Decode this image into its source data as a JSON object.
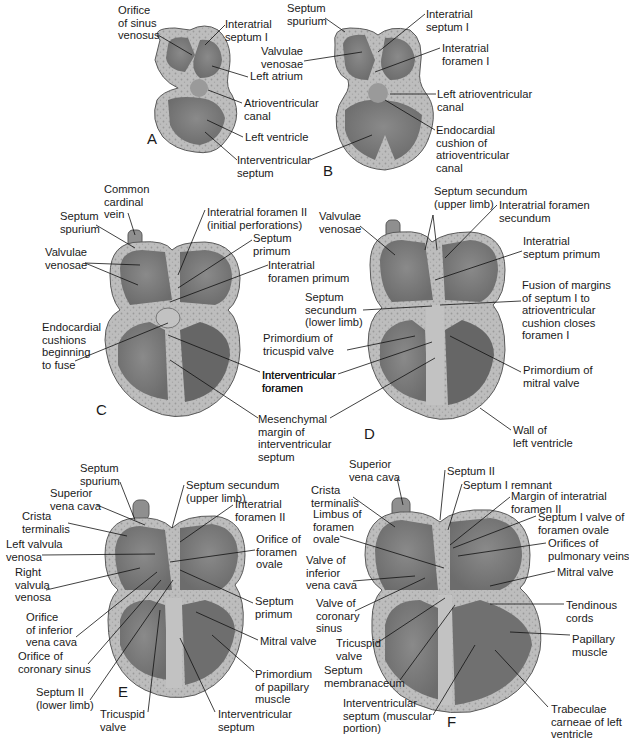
{
  "figure": {
    "colors": {
      "wall_outer": "#b7b7b7",
      "wall_stipple": "#a9a9a9",
      "chamber": "#7f7f7f",
      "chamber_dark": "#6a6a6a",
      "septum": "#bdbdbd",
      "outline": "#5a5a5a",
      "leader_line": "#111111"
    },
    "panels": [
      {
        "letter": "A",
        "labels": [
          {
            "text": "Orifice\nof sinus\nvenosus",
            "x": 118,
            "y": 4
          },
          {
            "text": "Interatrial\nseptum I",
            "x": 225,
            "y": 18
          },
          {
            "text": "Left atrium",
            "x": 250,
            "y": 70
          },
          {
            "text": "Atrioventricular\ncanal",
            "x": 244,
            "y": 97
          },
          {
            "text": "Left ventricle",
            "x": 245,
            "y": 131
          },
          {
            "text": "Interventricular\nseptum",
            "x": 237,
            "y": 154
          }
        ]
      },
      {
        "letter": "B",
        "labels": [
          {
            "text": "Septum\nspurium",
            "x": 287,
            "y": 2
          },
          {
            "text": "Interatrial\nseptum I",
            "x": 426,
            "y": 8
          },
          {
            "text": "Valvulae\nvenosae",
            "x": 261,
            "y": 45
          },
          {
            "text": "Interatrial\nforamen I",
            "x": 442,
            "y": 42
          },
          {
            "text": "Left atrioventricular\ncanal",
            "x": 437,
            "y": 88
          },
          {
            "text": "Endocardial\ncushion of\natrioventricular\ncanal",
            "x": 436,
            "y": 124
          }
        ]
      },
      {
        "letter": "C",
        "labels": [
          {
            "text": "Common\ncardinal\nvein",
            "x": 104,
            "y": 183
          },
          {
            "text": "Septum\nspurium",
            "x": 60,
            "y": 210
          },
          {
            "text": "Interatrial foramen II\n(initial perforations)",
            "x": 207,
            "y": 206
          },
          {
            "text": "Septum\nprimum",
            "x": 253,
            "y": 232
          },
          {
            "text": "Valvulae\nvenosae",
            "x": 45,
            "y": 246
          },
          {
            "text": "Interatrial\nforamen primum",
            "x": 268,
            "y": 259
          },
          {
            "text": "Endocardial\ncushions\nbeginning\nto fuse",
            "x": 42,
            "y": 321
          },
          {
            "text": "Interventricular\nforamen",
            "x": 262,
            "y": 369
          },
          {
            "text": "Mesenchymal\nmargin of\ninterventricular\nseptum",
            "x": 258,
            "y": 413
          }
        ]
      },
      {
        "letter": "D",
        "labels": [
          {
            "text": "Septum secundum\n(upper limb)",
            "x": 434,
            "y": 185
          },
          {
            "text": "Valvulae\nvenosae",
            "x": 319,
            "y": 210
          },
          {
            "text": "Interatrial foramen\nsecundum",
            "x": 499,
            "y": 199
          },
          {
            "text": "Interatrial\nseptum primum",
            "x": 523,
            "y": 235
          },
          {
            "text": "Fusion of margins\nof septum I to\natrioventricular\ncushion closes\nforamen I",
            "x": 522,
            "y": 279
          },
          {
            "text": "Septum\nsecundum\n(lower limb)",
            "x": 305,
            "y": 291
          },
          {
            "text": "Primordium of\ntricuspid valve",
            "x": 263,
            "y": 332
          },
          {
            "text": "Interventricular\nforamen",
            "x": 262,
            "y": 369
          },
          {
            "text": "Primordium of\nmitral valve",
            "x": 523,
            "y": 364
          },
          {
            "text": "Wall of\nleft ventricle",
            "x": 513,
            "y": 424
          }
        ]
      },
      {
        "letter": "E",
        "labels": [
          {
            "text": "Septum\nspurium",
            "x": 80,
            "y": 462
          },
          {
            "text": "Septum secundum\n(upper limb)",
            "x": 186,
            "y": 479
          },
          {
            "text": "Superior\nvena cava",
            "x": 50,
            "y": 487
          },
          {
            "text": "Interatrial\nforamen II",
            "x": 235,
            "y": 498
          },
          {
            "text": "Crista\nterminalis",
            "x": 22,
            "y": 510
          },
          {
            "text": "Left valvula\nvenosa",
            "x": 6,
            "y": 538
          },
          {
            "text": "Orifice of\nforamen\novale",
            "x": 256,
            "y": 533
          },
          {
            "text": "Right\nvalvula\nvenosa",
            "x": 15,
            "y": 566
          },
          {
            "text": "Septum\nprimum",
            "x": 255,
            "y": 595
          },
          {
            "text": "Orifice\nof inferior\nvena cava",
            "x": 26,
            "y": 611
          },
          {
            "text": "Orifice of\ncoronary sinus",
            "x": 18,
            "y": 650
          },
          {
            "text": "Mitral valve",
            "x": 260,
            "y": 635
          },
          {
            "text": "Primordium\nof papillary\nmuscle",
            "x": 255,
            "y": 668
          },
          {
            "text": "Septum II\n(lower limb)",
            "x": 36,
            "y": 686
          },
          {
            "text": "Tricuspid\nvalve",
            "x": 100,
            "y": 708
          },
          {
            "text": "Interventricular\nseptum",
            "x": 218,
            "y": 708
          }
        ]
      },
      {
        "letter": "F",
        "labels": [
          {
            "text": "Superior\nvena cava",
            "x": 349,
            "y": 458
          },
          {
            "text": "Septum II",
            "x": 447,
            "y": 465
          },
          {
            "text": "Crista\nterminalis",
            "x": 311,
            "y": 484
          },
          {
            "text": "Septum I remnant",
            "x": 463,
            "y": 479
          },
          {
            "text": "Margin of interatrial\nforamen II",
            "x": 511,
            "y": 490
          },
          {
            "text": "Limbus of\nforamen\novale",
            "x": 313,
            "y": 508
          },
          {
            "text": "Septum I valve of\nforamen ovale",
            "x": 538,
            "y": 511
          },
          {
            "text": "Orifices of\npulmonary veins",
            "x": 548,
            "y": 537
          },
          {
            "text": "Valve of\ninferior\nvena cava",
            "x": 306,
            "y": 554
          },
          {
            "text": "Mitral valve",
            "x": 557,
            "y": 566
          },
          {
            "text": "Valve of\ncoronary\nsinus",
            "x": 316,
            "y": 597
          },
          {
            "text": "Tendinous\ncords",
            "x": 566,
            "y": 599
          },
          {
            "text": "Tricuspid\nvalve",
            "x": 336,
            "y": 637
          },
          {
            "text": "Papillary\nmuscle",
            "x": 572,
            "y": 633
          },
          {
            "text": "Septum\nmembranaceum",
            "x": 324,
            "y": 664
          },
          {
            "text": "Interventricular\nseptum (muscular\nportion)",
            "x": 343,
            "y": 697
          },
          {
            "text": "Trabeculae\ncarneae of left\nventricle",
            "x": 551,
            "y": 703
          }
        ]
      }
    ]
  }
}
